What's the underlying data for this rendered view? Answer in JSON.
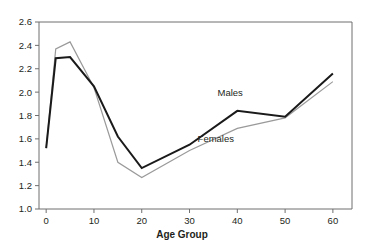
{
  "chart_data": {
    "type": "line",
    "title": "",
    "subtitle": "",
    "xlabel": "Age Group",
    "ylabel": "",
    "xlim": [
      -1.5,
      64
    ],
    "ylim": [
      1.0,
      2.6
    ],
    "grid": false,
    "legend_position": "inline-annotation",
    "x_ticks": [
      0,
      10,
      20,
      30,
      40,
      50,
      60
    ],
    "x_tick_labels": [
      "0",
      "10",
      "20",
      "30",
      "40",
      "50",
      "60"
    ],
    "y_ticks": [
      1.0,
      1.2,
      1.4,
      1.6,
      1.8,
      2.0,
      2.2,
      2.4,
      2.6
    ],
    "y_tick_labels": [
      "1.0",
      "1.2",
      "1.4",
      "1.6",
      "1.8",
      "2.0",
      "2.2",
      "2.4",
      "2.6"
    ],
    "x": [
      0,
      2,
      5,
      10,
      15,
      20,
      30,
      40,
      50,
      60
    ],
    "series": [
      {
        "name": "Males",
        "color": "#1a1a1a",
        "width": 2.0,
        "values": [
          1.52,
          2.29,
          2.3,
          2.05,
          1.62,
          1.35,
          1.55,
          1.84,
          1.79,
          2.16
        ]
      },
      {
        "name": "Females",
        "color": "#9a9a9a",
        "width": 1.2,
        "values": [
          1.52,
          2.37,
          2.43,
          2.04,
          1.4,
          1.27,
          1.5,
          1.69,
          1.78,
          2.09
        ]
      }
    ],
    "annotations": [
      {
        "text": "Males",
        "x": 38.5,
        "y": 1.97
      },
      {
        "text": "Females",
        "x": 35.5,
        "y": 1.57
      }
    ]
  },
  "axis": {
    "x_title": "Age Group"
  },
  "colors": {
    "males_line": "#1a1a1a",
    "females_line": "#9a9a9a",
    "axis": "#6f6f6f",
    "text": "#231f20",
    "background": "#ffffff"
  }
}
